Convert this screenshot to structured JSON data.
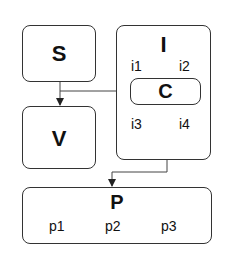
{
  "diagram": {
    "nodes": [
      {
        "id": "S",
        "label": "S",
        "children": []
      },
      {
        "id": "V",
        "label": "V",
        "children": []
      },
      {
        "id": "I",
        "label": "I",
        "children": [
          "i1",
          "i2",
          "C",
          "i3",
          "i4"
        ]
      },
      {
        "id": "C",
        "label": "C",
        "children": []
      },
      {
        "id": "P",
        "label": "P",
        "children": [
          "p1",
          "p2",
          "p3"
        ]
      }
    ],
    "edges": [
      {
        "from": "S",
        "to": "V"
      },
      {
        "from": "S",
        "to": "C"
      },
      {
        "from": "I",
        "to": "P"
      }
    ]
  },
  "labels": {
    "s": "S",
    "v": "V",
    "i": "I",
    "i1": "i1",
    "i2": "i2",
    "c": "C",
    "i3": "i3",
    "i4": "i4",
    "p": "P",
    "p1": "p1",
    "p2": "p2",
    "p3": "p3"
  }
}
